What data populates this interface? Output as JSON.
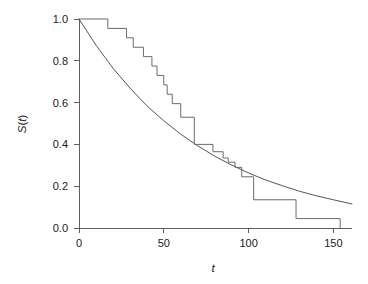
{
  "chart_data": {
    "type": "line",
    "title": "",
    "subtitle": "",
    "xlabel": "t",
    "ylabel": "S(t)",
    "xlim": [
      0,
      161
    ],
    "ylim": [
      0.0,
      1.0
    ],
    "grid": false,
    "legend": "none",
    "xticks": [
      0,
      50,
      100,
      150
    ],
    "xtick_labels": [
      "0",
      "50",
      "100",
      "150"
    ],
    "yticks": [
      0.0,
      0.2,
      0.4,
      0.6,
      0.8,
      1.0
    ],
    "ytick_labels": [
      "0.0",
      "0.2",
      "0.4",
      "0.6",
      "0.8",
      "1.0"
    ],
    "series": [
      {
        "name": "Kaplan-Meier estimate",
        "style": "step",
        "color": "#6b6b6b",
        "x": [
          0,
          17,
          28,
          32,
          38,
          43,
          46,
          50,
          52,
          55,
          60,
          68,
          79,
          85,
          88,
          92,
          96,
          103,
          128,
          154
        ],
        "values": [
          1.0,
          0.955,
          0.91,
          0.865,
          0.82,
          0.775,
          0.73,
          0.685,
          0.64,
          0.595,
          0.53,
          0.4,
          0.365,
          0.335,
          0.315,
          0.29,
          0.245,
          0.135,
          0.045,
          0.0
        ]
      },
      {
        "name": "Fitted exponential survival",
        "style": "smooth",
        "color": "#555555",
        "x": [
          0,
          10,
          20,
          30,
          40,
          50,
          60,
          70,
          80,
          90,
          100,
          110,
          120,
          130,
          140,
          150,
          161
        ],
        "values": [
          1.0,
          0.875,
          0.765,
          0.67,
          0.585,
          0.513,
          0.449,
          0.393,
          0.344,
          0.301,
          0.263,
          0.23,
          0.202,
          0.176,
          0.154,
          0.135,
          0.115
        ]
      }
    ],
    "annotations": []
  },
  "axes": {
    "y_axis_label": "S(t)",
    "y_axis_label_parts": {
      "fn": "S",
      "open": "(",
      "var": "t",
      "close": ")"
    },
    "x_axis_label": "t"
  },
  "colors": {
    "background": "#ffffff",
    "axis": "#4d4d4d",
    "step_curve": "#6b6b6b",
    "smooth_curve": "#555555",
    "text": "#1a1a1a"
  }
}
